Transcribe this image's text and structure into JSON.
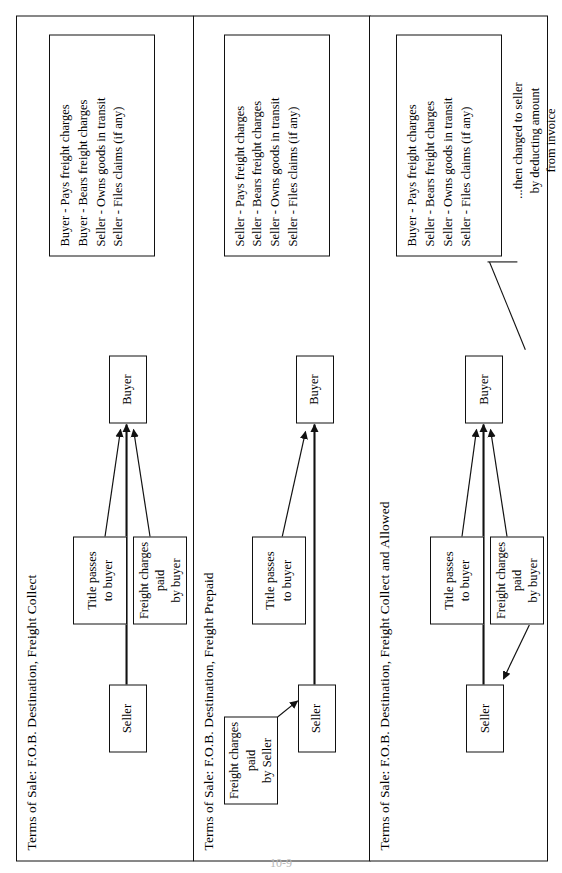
{
  "document": {
    "page_number": "10-9"
  },
  "panels": [
    {
      "id": "fob-destination-freight-collect",
      "title": "Terms of Sale: F.O.B. Destination, Freight Collect",
      "nodes": {
        "seller": "Seller",
        "buyer": "Buyer",
        "title_passes": "Title passes\nto buyer",
        "title_passes_line1": "Title passes",
        "title_passes_line2": "to buyer",
        "freight": "Freight charges paid\nby buyer",
        "freight_line1": "Freight charges paid",
        "freight_line2": "by buyer"
      },
      "legend": [
        "Buyer - Pays freight charges",
        "Buyer - Bears freight charges",
        "Seller - Owns goods in transit",
        "Seller - Files claims (if any)"
      ]
    },
    {
      "id": "fob-destination-freight-prepaid",
      "title": "Terms of Sale: F.O.B. Destination, Freight Prepaid",
      "nodes": {
        "seller": "Seller",
        "buyer": "Buyer",
        "title_passes_line1": "Title passes",
        "title_passes_line2": "to buyer",
        "freight_line1": "Freight charges paid",
        "freight_line2": "by Seller"
      },
      "legend": [
        "Seller - Pays freight charges",
        "Seller - Bears freight charges",
        "Seller - Owns goods in transit",
        "Seller - Files claims (if any)"
      ]
    },
    {
      "id": "fob-destination-freight-collect-and-allowed",
      "title": "Terms of Sale: F.O.B. Destination, Freight Collect and Allowed",
      "nodes": {
        "seller": "Seller",
        "buyer": "Buyer",
        "title_passes_line1": "Title passes",
        "title_passes_line2": "to buyer",
        "freight_line1": "Freight charges paid",
        "freight_line2": "by buyer"
      },
      "legend": [
        "Buyer - Pays freight charges",
        "Seller - Bears freight charges",
        "Seller - Owns goods in transit",
        "Seller - Files claims (if any)"
      ],
      "note_line1": "...then charged to seller",
      "note_line2": "by deducting amount",
      "note_line3": "from invoice"
    }
  ],
  "colors": {
    "ink": "#111111",
    "paper": "#ffffff"
  }
}
